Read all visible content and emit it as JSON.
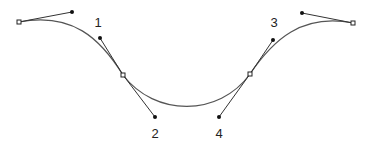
{
  "diagram": {
    "type": "bezier-curve-with-control-handles",
    "colors": {
      "curve": "#555555",
      "handle": "#333333",
      "point": "#111111",
      "anchor_fill": "#ffffff"
    },
    "anchors": [
      {
        "name": "left-endpoint",
        "x": 19,
        "y": 22
      },
      {
        "name": "left-mid-anchor",
        "x": 123,
        "y": 75
      },
      {
        "name": "right-mid-anchor",
        "x": 250,
        "y": 74
      },
      {
        "name": "right-endpoint",
        "x": 353,
        "y": 23
      }
    ],
    "handles": [
      {
        "name": "handle-left-end",
        "from": [
          19,
          22
        ],
        "to": [
          72,
          12
        ]
      },
      {
        "name": "handle-1",
        "from": [
          123,
          75
        ],
        "to": [
          100,
          38
        ]
      },
      {
        "name": "handle-2",
        "from": [
          123,
          75
        ],
        "to": [
          155,
          117
        ]
      },
      {
        "name": "handle-4",
        "from": [
          250,
          74
        ],
        "to": [
          219,
          117
        ]
      },
      {
        "name": "handle-3",
        "from": [
          250,
          74
        ],
        "to": [
          273,
          40
        ]
      },
      {
        "name": "handle-right-end",
        "from": [
          353,
          23
        ],
        "to": [
          302,
          13
        ]
      }
    ],
    "labels": [
      {
        "text": "1",
        "x": 98,
        "y": 22
      },
      {
        "text": "2",
        "x": 155,
        "y": 133
      },
      {
        "text": "3",
        "x": 274,
        "y": 22
      },
      {
        "text": "4",
        "x": 219,
        "y": 133
      }
    ]
  }
}
